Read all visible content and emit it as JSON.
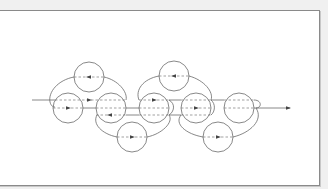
{
  "diagram": {
    "colors": {
      "background": "#f0f0f0",
      "canvas": "#ffffff",
      "stroke": "#6a6a6a",
      "arrow": "#444444"
    },
    "circle_radius": 15,
    "circles": [
      {
        "id": "top-1",
        "cx": 89,
        "cy": 77
      },
      {
        "id": "top-2",
        "cx": 174,
        "cy": 76
      },
      {
        "id": "mid-1",
        "cx": 68,
        "cy": 108
      },
      {
        "id": "mid-2",
        "cx": 111,
        "cy": 108
      },
      {
        "id": "mid-3",
        "cx": 154,
        "cy": 108
      },
      {
        "id": "mid-4",
        "cx": 196,
        "cy": 108
      },
      {
        "id": "mid-5",
        "cx": 239,
        "cy": 108
      },
      {
        "id": "bot-1",
        "cx": 132,
        "cy": 137
      },
      {
        "id": "bot-2",
        "cx": 218,
        "cy": 137
      }
    ],
    "arrows": [
      {
        "id": "arrow-top-1",
        "x": 89,
        "y": 77,
        "dir": "left"
      },
      {
        "id": "arrow-top-2",
        "x": 174,
        "y": 76,
        "dir": "left"
      },
      {
        "id": "arrow-mid-1",
        "x": 68,
        "y": 108,
        "dir": "right"
      },
      {
        "id": "arrow-mid-12",
        "x": 89,
        "y": 100,
        "dir": "right"
      },
      {
        "id": "arrow-mid-2",
        "x": 111,
        "y": 115,
        "dir": "left"
      },
      {
        "id": "arrow-mid-3",
        "x": 154,
        "y": 100,
        "dir": "right"
      },
      {
        "id": "arrow-mid-4",
        "x": 196,
        "y": 108,
        "dir": "right"
      },
      {
        "id": "arrow-bot-1",
        "x": 132,
        "y": 137,
        "dir": "right"
      },
      {
        "id": "arrow-bot-2",
        "x": 218,
        "y": 137,
        "dir": "right"
      },
      {
        "id": "arrow-exit",
        "x": 288,
        "y": 108,
        "dir": "right"
      }
    ]
  }
}
